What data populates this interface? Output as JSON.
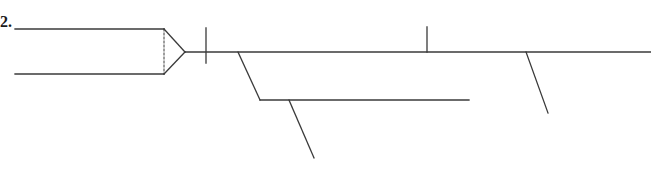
{
  "diagram": {
    "number_label": "2.",
    "stroke_color": "#3a3a3a",
    "background": "#ffffff",
    "elements": {
      "top_input_line": {
        "x1": 15,
        "y1": 29,
        "x2": 164,
        "y2": 29
      },
      "bottom_input_line": {
        "x1": 15,
        "y1": 74,
        "x2": 164,
        "y2": 74
      },
      "dashed_divider": {
        "x1": 164,
        "y1": 29,
        "x2": 164,
        "y2": 74
      },
      "arrow_top_edge": {
        "x1": 164,
        "y1": 29,
        "x2": 185,
        "y2": 52
      },
      "arrow_bottom_edge": {
        "x1": 164,
        "y1": 74,
        "x2": 185,
        "y2": 52
      },
      "main_line": {
        "x1": 185,
        "y1": 52,
        "x2": 651,
        "y2": 52
      },
      "cross_tick": {
        "x1": 206,
        "y1": 28,
        "x2": 206,
        "y2": 63
      },
      "upper_tick": {
        "x1": 427,
        "y1": 27,
        "x2": 427,
        "y2": 52
      },
      "branch_diagonal": {
        "x1": 238,
        "y1": 52,
        "x2": 260,
        "y2": 100
      },
      "branch_line": {
        "x1": 260,
        "y1": 100,
        "x2": 469,
        "y2": 100
      },
      "branch_sub_diagonal": {
        "x1": 289,
        "y1": 100,
        "x2": 314,
        "y2": 158
      },
      "right_diagonal": {
        "x1": 526,
        "y1": 52,
        "x2": 548,
        "y2": 113
      }
    }
  }
}
